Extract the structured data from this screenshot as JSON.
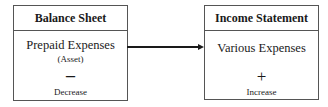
{
  "left_box": {
    "header": "Balance Sheet",
    "title": "Prepaid Expenses",
    "subtitle": "(Asset)",
    "sign": "–",
    "label": "Decrease"
  },
  "right_box": {
    "header": "Income Statement",
    "title": "Various Expenses",
    "sign": "+",
    "label": "Increase"
  },
  "connector": {
    "type": "arrow",
    "direction": "right",
    "color": "#1a1a1a"
  }
}
